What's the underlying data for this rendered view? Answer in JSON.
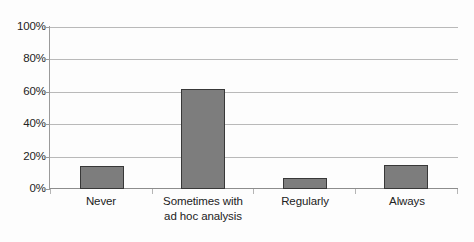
{
  "chart_data": {
    "type": "bar",
    "title": "",
    "subtitle": "",
    "xlabel": "",
    "ylabel": "",
    "categories": [
      "Never",
      "Sometimes with ad hoc analysis",
      "Regularly",
      "Always"
    ],
    "category_lines": [
      [
        "Never"
      ],
      [
        "Sometimes with",
        "ad hoc analysis"
      ],
      [
        "Regularly"
      ],
      [
        "Always"
      ]
    ],
    "values": [
      14,
      62,
      7,
      15
    ],
    "value_labels": [
      "14%",
      "62%",
      "7%",
      "15%"
    ],
    "ylim": [
      0,
      100
    ],
    "ytick_values": [
      0,
      20,
      40,
      60,
      80,
      100
    ],
    "ytick_labels": [
      "0%",
      "20%",
      "40%",
      "60%",
      "80%",
      "100%"
    ],
    "grid": true,
    "grid_axis": "y",
    "legend": false,
    "legend_position": "none",
    "bar_fill_color": "#7d7d7d",
    "bar_edge_color": "#383838",
    "gridline_color": "#b9b9b9",
    "axis_color": "#9a9a9a",
    "background_color": "#fdfdfd",
    "text_color": "#222222"
  }
}
